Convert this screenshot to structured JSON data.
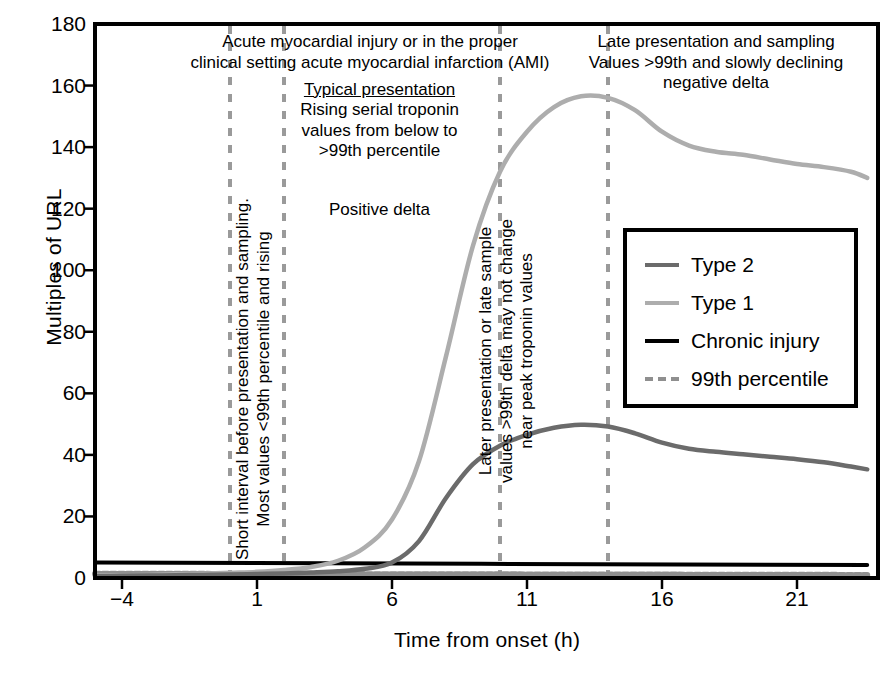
{
  "chart_data": {
    "type": "line",
    "title": "",
    "xlabel": "Time from onset (h)",
    "ylabel": "Multiples of URL",
    "xlim": [
      -5,
      24
    ],
    "ylim": [
      0,
      180
    ],
    "xticks": [
      -4,
      1,
      6,
      11,
      16,
      21
    ],
    "xtick_labels": [
      "−4",
      "1",
      "6",
      "11",
      "16",
      "21"
    ],
    "yticks": [
      0,
      20,
      40,
      60,
      80,
      100,
      120,
      140,
      160,
      180
    ],
    "ytick_labels": [
      "0",
      "20",
      "40",
      "60",
      "80",
      "100",
      "120",
      "140",
      "160",
      "180"
    ],
    "grid": false,
    "legend_position": "center-right",
    "series": [
      {
        "name": "Type 2",
        "color": "#6b6b6b",
        "style": "solid",
        "x": [
          -5,
          -4,
          -3,
          -2,
          -1,
          0,
          1,
          2,
          3,
          4,
          5,
          6,
          7,
          8,
          9,
          10,
          11,
          12,
          13,
          14,
          15,
          16,
          17,
          18,
          19,
          20,
          21,
          22,
          23,
          23.6
        ],
        "y": [
          0.6,
          0.7,
          0.8,
          0.9,
          1.0,
          1.1,
          1.3,
          1.5,
          1.8,
          2.2,
          3.0,
          5.0,
          12.0,
          26.0,
          37.0,
          43.0,
          46.5,
          48.8,
          49.8,
          49.2,
          47.0,
          44.0,
          42.0,
          41.0,
          40.2,
          39.4,
          38.6,
          37.6,
          36.2,
          35.3
        ]
      },
      {
        "name": "Type 1",
        "color": "#adadad",
        "style": "solid",
        "x": [
          -5,
          -4,
          -3,
          -2,
          -1,
          0,
          1,
          2,
          3,
          4,
          5,
          6,
          7,
          8,
          9,
          10,
          11,
          12,
          13,
          14,
          15,
          16,
          17,
          18,
          19,
          20,
          21,
          22,
          23,
          23.6
        ],
        "y": [
          0.8,
          0.9,
          1.0,
          1.2,
          1.4,
          1.7,
          2.0,
          2.6,
          3.6,
          5.6,
          10.0,
          19.0,
          38.0,
          72.0,
          108.0,
          132.0,
          145.0,
          153.0,
          156.5,
          156.0,
          152.0,
          145.0,
          140.5,
          138.5,
          137.5,
          136.0,
          134.5,
          133.5,
          132.0,
          130.0
        ]
      },
      {
        "name": "Chronic injury",
        "color": "#000000",
        "style": "solid",
        "x": [
          -5,
          23.6
        ],
        "y": [
          5.0,
          4.2
        ]
      },
      {
        "name": "99th percentile",
        "color": "#8f8f8f",
        "style": "dashed-thick",
        "x": [
          -5,
          23.6
        ],
        "y": [
          1.4,
          1.0
        ]
      }
    ],
    "vertical_markers": [
      {
        "x": 0.0,
        "style": "dashed",
        "color": "#9a9a9a"
      },
      {
        "x": 2.0,
        "style": "dashed",
        "color": "#9a9a9a"
      },
      {
        "x": 10.0,
        "style": "dashed",
        "color": "#9a9a9a"
      },
      {
        "x": 14.0,
        "style": "dashed",
        "color": "#9a9a9a"
      }
    ],
    "annotations": [
      {
        "name": "header-annotation",
        "text": "Acute myocardial injury or in the proper\nclinical setting acute myocardial infarction (AMI)",
        "orientation": "horizontal"
      },
      {
        "name": "late-presentation-annotation",
        "text": "Late presentation and sampling\nValues >99th and slowly declining\nnegative delta",
        "orientation": "horizontal"
      },
      {
        "name": "typical-presentation-title",
        "text": "Typical presentation",
        "orientation": "horizontal",
        "underline": true
      },
      {
        "name": "typical-presentation-body",
        "text": "Rising serial troponin\nvalues from below to\n>99th percentile",
        "orientation": "horizontal"
      },
      {
        "name": "positive-delta-annotation",
        "text": "Positive delta",
        "orientation": "horizontal"
      },
      {
        "name": "short-interval-annotation",
        "text": "Short interval before presentation and sampling.\nMost values <99th percentile and rising",
        "orientation": "vertical"
      },
      {
        "name": "later-presentation-annotation",
        "text": "Later presentation or late sample\nvalues >99th delta may not change\nnear peak troponin values",
        "orientation": "vertical"
      }
    ]
  },
  "legend": {
    "items": [
      {
        "label": "Type 2",
        "color": "#6b6b6b"
      },
      {
        "label": "Type 1",
        "color": "#adadad"
      },
      {
        "label": "Chronic injury",
        "color": "#000000"
      },
      {
        "label": "99th percentile",
        "color": "#8f8f8f"
      }
    ]
  }
}
